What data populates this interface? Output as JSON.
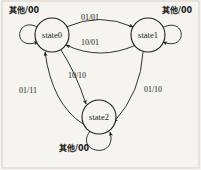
{
  "diagram": {
    "type": "mealy-state-machine",
    "background_color": "#f6f4f0",
    "ink_color": "#1c1c1c",
    "states": [
      {
        "id": "state0",
        "label": "state0",
        "cx": 52,
        "cy": 35,
        "r": 17
      },
      {
        "id": "state1",
        "label": "state1",
        "cx": 148,
        "cy": 35,
        "r": 17
      },
      {
        "id": "state2",
        "label": "state2",
        "cx": 99,
        "cy": 117,
        "r": 17
      }
    ],
    "self_loops": [
      {
        "id": "loop-state0",
        "state": "state0",
        "label": "其他/00",
        "label_x": 9,
        "label_y": 13
      },
      {
        "id": "loop-state1",
        "state": "state1",
        "label": "其他/00",
        "label_x": 162,
        "label_y": 13
      },
      {
        "id": "loop-state2",
        "state": "state2",
        "label": "其他/00",
        "label_x": 59,
        "label_y": 151
      }
    ],
    "transitions": [
      {
        "id": "t0-1",
        "from": "state0",
        "to": "state1",
        "label": "01/01",
        "label_x": 90,
        "label_y": 20
      },
      {
        "id": "t1-0",
        "from": "state1",
        "to": "state0",
        "label": "10/01",
        "label_x": 90,
        "label_y": 45
      },
      {
        "id": "t0-2",
        "from": "state0",
        "to": "state2",
        "label": "10/10",
        "label_x": 77,
        "label_y": 78
      },
      {
        "id": "t2-0",
        "from": "state2",
        "to": "state0",
        "label": "01/11",
        "label_x": 28,
        "label_y": 93
      },
      {
        "id": "t1-2",
        "from": "state1",
        "to": "state2",
        "label": "01/10",
        "label_x": 153,
        "label_y": 92
      }
    ]
  }
}
